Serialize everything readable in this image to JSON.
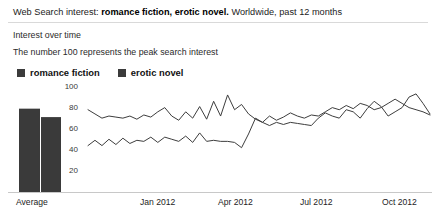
{
  "header": {
    "lead": "Web Search interest:",
    "terms": "romance fiction, erotic novel.",
    "scope": "Worldwide, past 12 months",
    "subtitle": "Interest over time",
    "caption": "The number 100 represents the peak search interest"
  },
  "legend": {
    "items": [
      {
        "label": "romance fiction",
        "color": "#3b3b3b"
      },
      {
        "label": "erotic novel",
        "color": "#3b3b3b"
      }
    ]
  },
  "average_bars": {
    "axis_label": "Average",
    "bars": [
      {
        "name": "romance fiction",
        "value": 79,
        "color": "#3a3a3a"
      },
      {
        "name": "erotic novel",
        "value": 71,
        "color": "#3a3a3a"
      }
    ]
  },
  "chart_data": {
    "type": "line",
    "title": "Interest over time",
    "xlabel": "",
    "ylabel": "",
    "ylim": [
      0,
      100
    ],
    "yticks": [
      20,
      40,
      60,
      80,
      100
    ],
    "grid": false,
    "legend_position": "top-left",
    "annotation": "The number 100 represents the peak search interest",
    "xticks": [
      "Average",
      "Jan 2012",
      "Apr 2012",
      "Jul 2012",
      "Oct 2012"
    ],
    "x": [
      "Oct 2011 w1",
      "Oct 2011 w2",
      "Oct 2011 w3",
      "Oct 2011 w4",
      "Nov 2011 w1",
      "Nov 2011 w2",
      "Nov 2011 w3",
      "Nov 2011 w4",
      "Dec 2011 w1",
      "Dec 2011 w2",
      "Dec 2011 w3",
      "Dec 2011 w4",
      "Jan 2012 w1",
      "Jan 2012 w2",
      "Jan 2012 w3",
      "Jan 2012 w4",
      "Feb 2012 w1",
      "Feb 2012 w2",
      "Feb 2012 w3",
      "Feb 2012 w4",
      "Mar 2012 w1",
      "Mar 2012 w2",
      "Mar 2012 w3",
      "Mar 2012 w4",
      "Apr 2012 w1",
      "Apr 2012 w2",
      "Apr 2012 w3",
      "Apr 2012 w4",
      "May 2012 w1",
      "May 2012 w2",
      "May 2012 w3",
      "May 2012 w4",
      "Jun 2012 w1",
      "Jun 2012 w2",
      "Jun 2012 w3",
      "Jun 2012 w4",
      "Jul 2012 w1",
      "Jul 2012 w2",
      "Jul 2012 w3",
      "Jul 2012 w4",
      "Aug 2012 w1",
      "Aug 2012 w2",
      "Aug 2012 w3",
      "Aug 2012 w4",
      "Sep 2012 w1",
      "Sep 2012 w2",
      "Sep 2012 w3",
      "Sep 2012 w4",
      "Oct 2012 w1",
      "Oct 2012 w2"
    ],
    "series": [
      {
        "name": "romance fiction",
        "values": [
          78,
          74,
          70,
          72,
          71,
          70,
          72,
          69,
          73,
          71,
          76,
          80,
          72,
          68,
          76,
          70,
          81,
          69,
          86,
          72,
          92,
          78,
          83,
          74,
          69,
          66,
          63,
          66,
          64,
          66,
          65,
          64,
          63,
          70,
          75,
          72,
          70,
          78,
          76,
          70,
          79,
          86,
          81,
          72,
          76,
          80,
          90,
          93,
          84,
          74
        ]
      },
      {
        "name": "erotic novel",
        "values": [
          44,
          49,
          44,
          50,
          45,
          51,
          46,
          49,
          48,
          52,
          47,
          52,
          50,
          48,
          53,
          47,
          56,
          48,
          49,
          48,
          48,
          47,
          42,
          55,
          70,
          66,
          72,
          68,
          71,
          75,
          72,
          70,
          73,
          72,
          76,
          80,
          78,
          82,
          79,
          84,
          82,
          78,
          80,
          84,
          88,
          84,
          80,
          78,
          76,
          73
        ]
      }
    ]
  }
}
